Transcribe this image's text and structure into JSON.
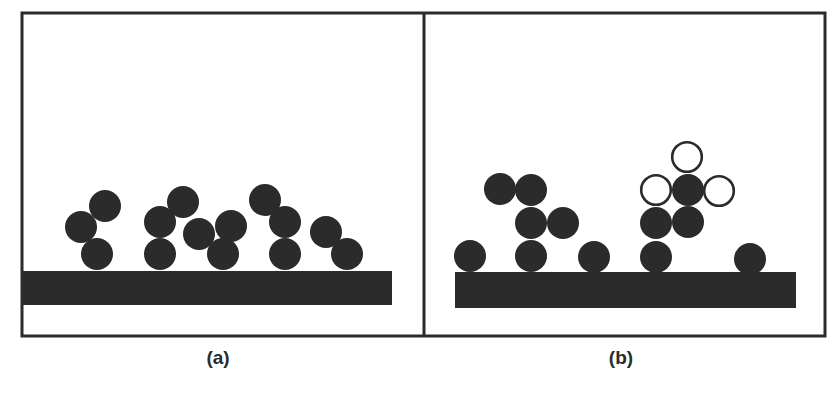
{
  "figure": {
    "colors": {
      "frame": "#2b2b2b",
      "particle_fill": "#2b2b2b",
      "substrate": "#2b2b2b",
      "open_particle_stroke": "#2b2b2b",
      "open_particle_fill": "#ffffff",
      "background": "#ffffff"
    },
    "frame": {
      "x": 22,
      "y": 13,
      "width": 803,
      "height": 323,
      "divider_x": 424
    },
    "panels": [
      {
        "id": "a",
        "label": "(a)",
        "label_pos": {
          "x": 218,
          "y": 348
        },
        "substrate": {
          "x": 22,
          "y": 271,
          "width": 370,
          "height": 34
        },
        "particle_radius": 16,
        "filled_particles": [
          {
            "cx": 97,
            "cy": 254
          },
          {
            "cx": 81,
            "cy": 227
          },
          {
            "cx": 105,
            "cy": 206
          },
          {
            "cx": 160,
            "cy": 254
          },
          {
            "cx": 160,
            "cy": 222
          },
          {
            "cx": 183,
            "cy": 202
          },
          {
            "cx": 199,
            "cy": 234
          },
          {
            "cx": 223,
            "cy": 254
          },
          {
            "cx": 231,
            "cy": 226
          },
          {
            "cx": 285,
            "cy": 254
          },
          {
            "cx": 285,
            "cy": 222
          },
          {
            "cx": 265,
            "cy": 200
          },
          {
            "cx": 326,
            "cy": 232
          },
          {
            "cx": 347,
            "cy": 254
          }
        ],
        "open_particles": []
      },
      {
        "id": "b",
        "label": "(b)",
        "label_pos": {
          "x": 621,
          "y": 348
        },
        "substrate": {
          "x": 455,
          "y": 272,
          "width": 341,
          "height": 36
        },
        "particle_radius": 16,
        "filled_particles": [
          {
            "cx": 470,
            "cy": 256
          },
          {
            "cx": 531,
            "cy": 256
          },
          {
            "cx": 594,
            "cy": 257
          },
          {
            "cx": 656,
            "cy": 257
          },
          {
            "cx": 750,
            "cy": 259
          },
          {
            "cx": 531,
            "cy": 223
          },
          {
            "cx": 563,
            "cy": 223
          },
          {
            "cx": 531,
            "cy": 190
          },
          {
            "cx": 500,
            "cy": 189
          },
          {
            "cx": 656,
            "cy": 223
          },
          {
            "cx": 688,
            "cy": 222
          },
          {
            "cx": 688,
            "cy": 190
          }
        ],
        "open_particles": [
          {
            "cx": 656,
            "cy": 190
          },
          {
            "cx": 687,
            "cy": 157
          },
          {
            "cx": 719,
            "cy": 191
          }
        ]
      }
    ]
  }
}
